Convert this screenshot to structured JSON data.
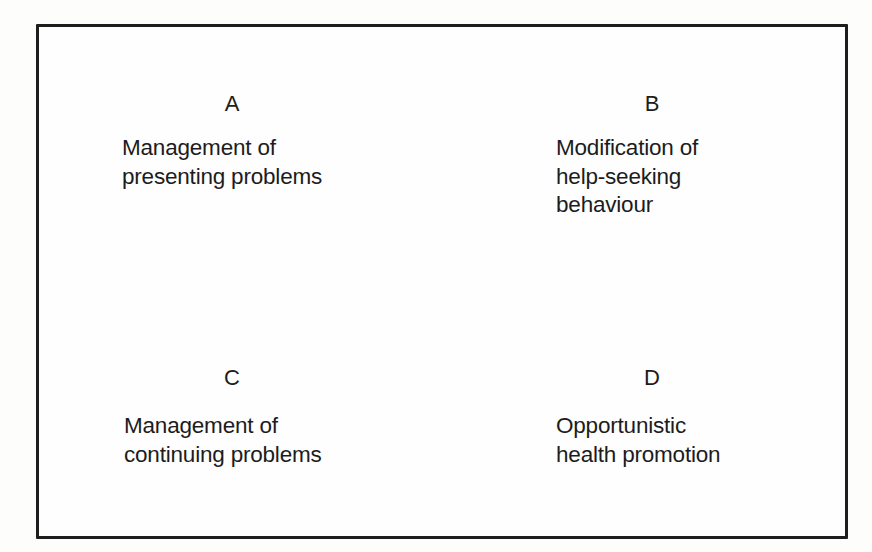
{
  "diagram": {
    "type": "2x2 grid",
    "quadrants": [
      {
        "id": "A",
        "letter": "A",
        "lines": [
          "Management of",
          "presenting problems"
        ]
      },
      {
        "id": "B",
        "letter": "B",
        "lines": [
          "Modification of",
          "help-seeking",
          "behaviour"
        ]
      },
      {
        "id": "C",
        "letter": "C",
        "lines": [
          "Management of",
          "continuing problems"
        ]
      },
      {
        "id": "D",
        "letter": "D",
        "lines": [
          "Opportunistic",
          "health promotion"
        ]
      }
    ]
  },
  "colors": {
    "background": "#fdfdfb",
    "border": "#1e1e1e",
    "text": "#1c1c1c"
  }
}
